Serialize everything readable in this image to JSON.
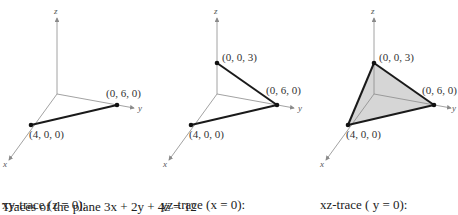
{
  "panels": [
    {
      "id": "xy",
      "points": {
        "x": "(4, 0, 0)",
        "y": "(0, 6, 0)"
      },
      "caption_line1": "xy-trace (z = 0):",
      "caption_line2": "3x + 2y = 12"
    },
    {
      "id": "yz",
      "points": {
        "x": "(4, 0, 0)",
        "y": "(0, 6, 0)",
        "z": "(0, 0, 3)"
      },
      "caption_line1": "yz-trace (x = 0):",
      "caption_line2": "2y + 4z = 12"
    },
    {
      "id": "xz",
      "points": {
        "x": "(4, 0, 0)",
        "y": "(0, 6, 0)",
        "z": "(0, 0, 3)"
      },
      "caption_line1": "xz-trace ( y = 0):",
      "caption_line2": "3x + 4z = 12"
    }
  ],
  "axes": {
    "x": "x",
    "y": "y",
    "z": "z"
  },
  "figure_caption": "Traces of the plane 3x + 2y + 4z = 12",
  "colors": {
    "axis": "#8a8a8a",
    "trace": "#1a1a1a",
    "fill": "#d6d6d6"
  }
}
